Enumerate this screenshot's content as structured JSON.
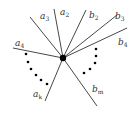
{
  "diagram": {
    "center": {
      "x": 63,
      "y": 58,
      "r": 3.2
    },
    "rays": [
      {
        "id": "a4",
        "base": "a",
        "sub": "4",
        "end": {
          "x": 13,
          "y": 48
        },
        "label": {
          "x": 15,
          "y": 46
        }
      },
      {
        "id": "a3",
        "base": "a",
        "sub": "3",
        "end": {
          "x": 30,
          "y": 17
        },
        "label": {
          "x": 40,
          "y": 19
        }
      },
      {
        "id": "a2",
        "base": "a",
        "sub": "2",
        "end": {
          "x": 54,
          "y": 9
        },
        "label": {
          "x": 60,
          "y": 15
        }
      },
      {
        "id": "b2",
        "base": "b",
        "sub": "2",
        "end": {
          "x": 86,
          "y": 10
        },
        "label": {
          "x": 89,
          "y": 18
        }
      },
      {
        "id": "b3",
        "base": "b",
        "sub": "3",
        "end": {
          "x": 117,
          "y": 15
        },
        "label": {
          "x": 115,
          "y": 19
        }
      },
      {
        "id": "b4",
        "base": "b",
        "sub": "4",
        "end": {
          "x": 127,
          "y": 28
        },
        "label": {
          "x": 118,
          "y": 45
        }
      },
      {
        "id": "ak",
        "base": "a",
        "sub": "k",
        "end": {
          "x": 45,
          "y": 101
        },
        "label": {
          "x": 33,
          "y": 97
        }
      },
      {
        "id": "bm",
        "base": "b",
        "sub": "m",
        "end": {
          "x": 97,
          "y": 106
        },
        "label": {
          "x": 92,
          "y": 92
        }
      }
    ],
    "left_dots": [
      {
        "x": 26,
        "y": 54
      },
      {
        "x": 28,
        "y": 62
      },
      {
        "x": 31,
        "y": 69
      },
      {
        "x": 36,
        "y": 75
      },
      {
        "x": 41,
        "y": 80
      },
      {
        "x": 47,
        "y": 84
      }
    ],
    "right_dots": [
      {
        "x": 96,
        "y": 49
      },
      {
        "x": 96,
        "y": 56
      },
      {
        "x": 95,
        "y": 63
      },
      {
        "x": 90,
        "y": 69
      },
      {
        "x": 84,
        "y": 73
      }
    ]
  }
}
